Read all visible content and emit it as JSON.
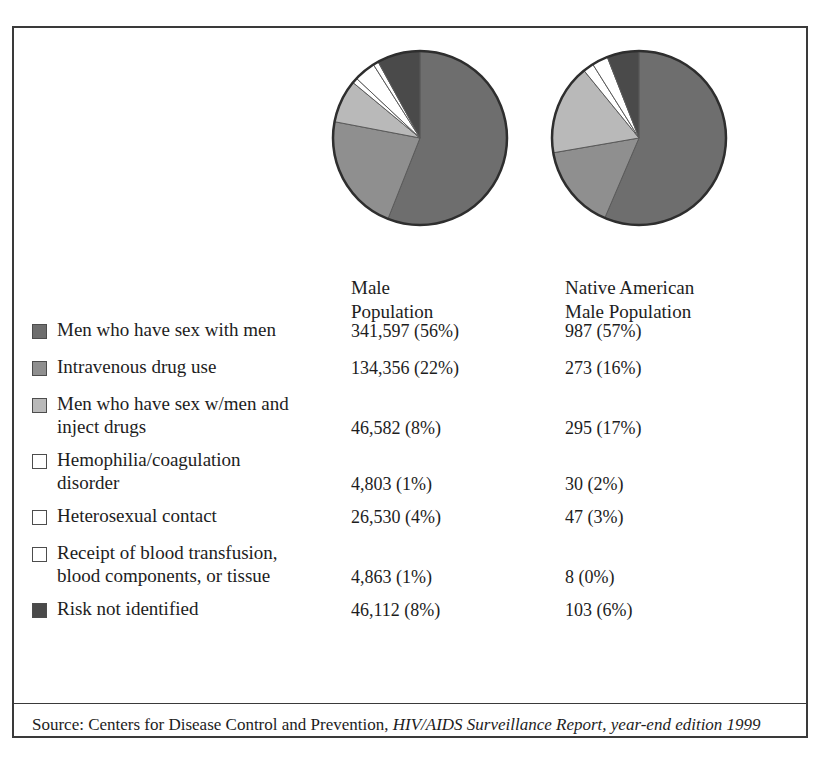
{
  "figure": {
    "columns": [
      {
        "id": "male",
        "header": "Male\nPopulation"
      },
      {
        "id": "native",
        "header": "Native American\nMale Population"
      }
    ],
    "source": {
      "prefix": "Source: Centers for Disease Control and Prevention, ",
      "smallcaps": "HIV/AIDS",
      "italic": " Surveillance Report, year-end edition 1999"
    }
  },
  "chart_data": {
    "type": "pie",
    "title": "",
    "legend_position": "left",
    "categories": [
      "Men who have sex with men",
      "Intravenous drug use",
      "Men who have sex w/men and\ninject drugs",
      "Hemophilia/coagulation\ndisorder",
      "Heterosexual contact",
      "Receipt of blood transfusion,\nblood components, or tissue",
      "Risk not identified"
    ],
    "colors": [
      "#6e6e6e",
      "#8f8f8f",
      "#b9b9b9",
      "#ffffff",
      "#ffffff",
      "#ffffff",
      "#4a4a4a"
    ],
    "swatch_colors": [
      "#6e6e6e",
      "#8f8f8f",
      "#b9b9b9",
      "#ffffff",
      "#ffffff",
      "#ffffff",
      "#4a4a4a"
    ],
    "series": [
      {
        "name": "Male Population",
        "values": [
          341597,
          134356,
          46582,
          4803,
          26530,
          4863,
          46112
        ],
        "percents": [
          56,
          22,
          8,
          1,
          4,
          1,
          8
        ],
        "labels": [
          "341,597 (56%)",
          "134,356 (22%)",
          "46,582 (8%)",
          "4,803 (1%)",
          "26,530 (4%)",
          "4,863 (1%)",
          "46,112 (8%)"
        ]
      },
      {
        "name": "Native American Male Population",
        "values": [
          987,
          273,
          295,
          30,
          47,
          8,
          103
        ],
        "percents": [
          57,
          16,
          17,
          2,
          3,
          0,
          6
        ],
        "labels": [
          "987 (57%)",
          "273 (16%)",
          "295 (17%)",
          "30 (2%)",
          "47 (3%)",
          "8 (0%)",
          "103 (6%)"
        ]
      }
    ]
  }
}
